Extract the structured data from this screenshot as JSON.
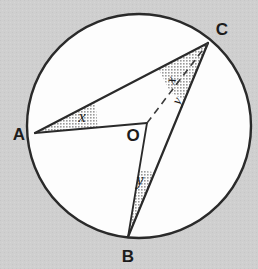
{
  "figure": {
    "background_color": "#cfcfcf",
    "circle_fill": "#fdfdfd",
    "stroke_color": "#2a2a2a",
    "wedge_fill": "#b9b9b9",
    "dash_color": "#3a3a3a"
  },
  "circle": {
    "cx": 139,
    "cy": 126,
    "r": 112,
    "stroke_width": 2.4
  },
  "points": [
    {
      "id": "A",
      "label": "A",
      "x": 35,
      "y": 133,
      "label_x": 19,
      "label_y": 140
    },
    {
      "id": "B",
      "label": "B",
      "x": 128,
      "y": 237,
      "label_x": 128,
      "label_y": 262
    },
    {
      "id": "C",
      "label": "C",
      "x": 208,
      "y": 43,
      "label_x": 222,
      "label_y": 35
    },
    {
      "id": "O",
      "label": "O",
      "x": 147,
      "y": 123,
      "label_x": 133,
      "label_y": 141
    }
  ],
  "segments": [
    {
      "id": "AC",
      "from": "A",
      "to": "C",
      "style": "solid",
      "width": 2.2
    },
    {
      "id": "AO",
      "from": "A",
      "to": "O",
      "style": "solid",
      "width": 1.8
    },
    {
      "id": "OB",
      "from": "O",
      "to": "B",
      "style": "solid",
      "width": 1.8
    },
    {
      "id": "BC",
      "from": "B",
      "to": "C",
      "style": "solid",
      "width": 2.2
    },
    {
      "id": "OC",
      "from": "O",
      "to": "C",
      "style": "dashed",
      "width": 1.6
    }
  ],
  "angles": [
    {
      "id": "angle-A",
      "vertex": "A",
      "label": "x",
      "label_x": 82,
      "label_y": 122,
      "between": [
        "AC",
        "AO"
      ],
      "shaded": true
    },
    {
      "id": "angle-C-upper",
      "vertex": "C",
      "label": "x",
      "label_x": 175,
      "label_y": 82,
      "between": [
        "CA",
        "CO"
      ],
      "shaded": true
    },
    {
      "id": "angle-C-lower",
      "vertex": "C",
      "label": "y",
      "label_x": 181,
      "label_y": 103,
      "between": [
        "CO",
        "CB"
      ],
      "shaded": true
    },
    {
      "id": "angle-B",
      "vertex": "B",
      "label": "y",
      "label_x": 140,
      "label_y": 185,
      "between": [
        "BO",
        "BC"
      ],
      "shaded": true
    }
  ]
}
